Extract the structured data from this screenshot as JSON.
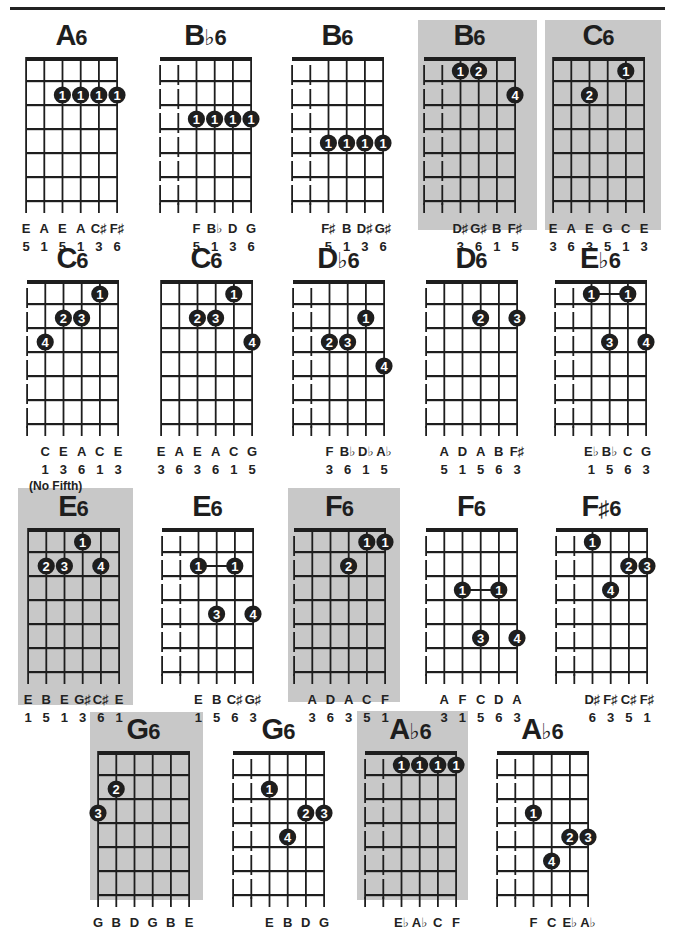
{
  "page": {
    "highlight_color": "#c8c8c8",
    "ink_color": "#1e1e1e"
  },
  "chords": [
    {
      "id": "a6",
      "root": "A",
      "suffix": "6",
      "highlighted": false,
      "x": 26,
      "nut_y": 57,
      "muted_low": 0,
      "dots": [
        {
          "s": 2,
          "f": 2,
          "n": "1"
        },
        {
          "s": 3,
          "f": 2,
          "n": "1"
        },
        {
          "s": 4,
          "f": 2,
          "n": "1"
        },
        {
          "s": 5,
          "f": 2,
          "n": "1"
        }
      ],
      "bar_links": [],
      "notes": [
        "E",
        "A",
        "E",
        "A",
        "C♯",
        "F♯"
      ],
      "degrees": [
        "5",
        "1",
        "5",
        "1",
        "3",
        "6"
      ]
    },
    {
      "id": "bb6",
      "root": "B",
      "suffix": "♭6",
      "highlighted": false,
      "x": 160,
      "nut_y": 57,
      "muted_low": 2,
      "dots": [
        {
          "s": 2,
          "f": 3,
          "n": "1"
        },
        {
          "s": 3,
          "f": 3,
          "n": "1"
        },
        {
          "s": 4,
          "f": 3,
          "n": "1"
        },
        {
          "s": 5,
          "f": 3,
          "n": "1"
        }
      ],
      "bar_links": [],
      "notes": [
        "",
        "",
        "F",
        "B♭",
        "D",
        "G"
      ],
      "degrees": [
        "",
        "",
        "5",
        "1",
        "3",
        "6"
      ]
    },
    {
      "id": "b6-a",
      "root": "B",
      "suffix": "6",
      "highlighted": false,
      "x": 292,
      "nut_y": 57,
      "muted_low": 2,
      "dots": [
        {
          "s": 2,
          "f": 4,
          "n": "1"
        },
        {
          "s": 3,
          "f": 4,
          "n": "1"
        },
        {
          "s": 4,
          "f": 4,
          "n": "1"
        },
        {
          "s": 5,
          "f": 4,
          "n": "1"
        }
      ],
      "bar_links": [],
      "notes": [
        "",
        "",
        "F♯",
        "B",
        "D♯",
        "G♯"
      ],
      "degrees": [
        "",
        "",
        "5",
        "1",
        "3",
        "6"
      ]
    },
    {
      "id": "b6-b",
      "root": "B",
      "suffix": "6",
      "highlighted": true,
      "x": 424,
      "nut_y": 57,
      "muted_low": 2,
      "dots": [
        {
          "s": 2,
          "f": 1,
          "n": "1"
        },
        {
          "s": 3,
          "f": 1,
          "n": "2"
        },
        {
          "s": 5,
          "f": 2,
          "n": "4"
        }
      ],
      "bar_links": [],
      "notes": [
        "",
        "",
        "D♯",
        "G♯",
        "B",
        "F♯"
      ],
      "degrees": [
        "",
        "",
        "3",
        "6",
        "1",
        "5"
      ]
    },
    {
      "id": "c6-a",
      "root": "C",
      "suffix": "6",
      "highlighted": true,
      "x": 553,
      "nut_y": 57,
      "muted_low": 0,
      "dots": [
        {
          "s": 4,
          "f": 1,
          "n": "1"
        },
        {
          "s": 2,
          "f": 2,
          "n": "2"
        }
      ],
      "bar_links": [],
      "notes": [
        "E",
        "A",
        "E",
        "G",
        "C",
        "E"
      ],
      "degrees": [
        "3",
        "6",
        "3",
        "5",
        "1",
        "3"
      ]
    },
    {
      "id": "c6-b",
      "root": "C",
      "suffix": "6",
      "highlighted": false,
      "x": 27,
      "nut_y": 280,
      "muted_low": 1,
      "dots": [
        {
          "s": 4,
          "f": 1,
          "n": "1"
        },
        {
          "s": 2,
          "f": 2,
          "n": "2"
        },
        {
          "s": 3,
          "f": 2,
          "n": "3"
        },
        {
          "s": 1,
          "f": 3,
          "n": "4"
        }
      ],
      "bar_links": [],
      "notes": [
        "",
        "C",
        "E",
        "A",
        "C",
        "E"
      ],
      "degrees": [
        "",
        "1",
        "3",
        "6",
        "1",
        "3"
      ],
      "footnote": "(No Fifth)"
    },
    {
      "id": "c6-c",
      "root": "C",
      "suffix": "6",
      "highlighted": false,
      "x": 161,
      "nut_y": 280,
      "muted_low": 0,
      "dots": [
        {
          "s": 4,
          "f": 1,
          "n": "1"
        },
        {
          "s": 2,
          "f": 2,
          "n": "2"
        },
        {
          "s": 3,
          "f": 2,
          "n": "3"
        },
        {
          "s": 5,
          "f": 3,
          "n": "4"
        }
      ],
      "bar_links": [],
      "notes": [
        "E",
        "A",
        "E",
        "A",
        "C",
        "G"
      ],
      "degrees": [
        "3",
        "6",
        "3",
        "6",
        "1",
        "5"
      ]
    },
    {
      "id": "db6",
      "root": "D",
      "suffix": "♭6",
      "highlighted": false,
      "x": 293,
      "nut_y": 280,
      "muted_low": 2,
      "dots": [
        {
          "s": 4,
          "f": 2,
          "n": "1"
        },
        {
          "s": 2,
          "f": 3,
          "n": "2"
        },
        {
          "s": 3,
          "f": 3,
          "n": "3"
        },
        {
          "s": 5,
          "f": 4,
          "n": "4"
        }
      ],
      "bar_links": [],
      "notes": [
        "",
        "",
        "F",
        "B♭",
        "D♭",
        "A♭"
      ],
      "degrees": [
        "",
        "",
        "3",
        "6",
        "1",
        "5"
      ]
    },
    {
      "id": "d6",
      "root": "D",
      "suffix": "6",
      "highlighted": false,
      "x": 426,
      "nut_y": 280,
      "muted_low": 1,
      "dots": [
        {
          "s": 3,
          "f": 2,
          "n": "2"
        },
        {
          "s": 5,
          "f": 2,
          "n": "3"
        }
      ],
      "bar_links": [],
      "notes": [
        "",
        "A",
        "D",
        "A",
        "B",
        "F♯"
      ],
      "degrees": [
        "",
        "5",
        "1",
        "5",
        "6",
        "3"
      ]
    },
    {
      "id": "eb6",
      "root": "E",
      "suffix": "♭6",
      "highlighted": false,
      "x": 555,
      "nut_y": 280,
      "muted_low": 2,
      "dots": [
        {
          "s": 2,
          "f": 1,
          "n": "1"
        },
        {
          "s": 4,
          "f": 1,
          "n": "1"
        },
        {
          "s": 3,
          "f": 3,
          "n": "3"
        },
        {
          "s": 5,
          "f": 3,
          "n": "4"
        }
      ],
      "bar_links": [
        {
          "f": 1,
          "from": 2,
          "to": 4
        }
      ],
      "notes": [
        "",
        "",
        "E♭",
        "B♭",
        "C",
        "G"
      ],
      "degrees": [
        "",
        "",
        "1",
        "5",
        "6",
        "3"
      ]
    },
    {
      "id": "e6-a",
      "root": "E",
      "suffix": "6",
      "highlighted": true,
      "x": 28,
      "nut_y": 528,
      "muted_low": 0,
      "dots": [
        {
          "s": 3,
          "f": 1,
          "n": "1"
        },
        {
          "s": 1,
          "f": 2,
          "n": "2"
        },
        {
          "s": 2,
          "f": 2,
          "n": "3"
        },
        {
          "s": 4,
          "f": 2,
          "n": "4"
        }
      ],
      "bar_links": [],
      "notes": [
        "E",
        "B",
        "E",
        "G♯",
        "C♯",
        "E"
      ],
      "degrees": [
        "1",
        "5",
        "1",
        "3",
        "6",
        "1"
      ]
    },
    {
      "id": "e6-b",
      "root": "E",
      "suffix": "6",
      "highlighted": false,
      "x": 162,
      "nut_y": 528,
      "muted_low": 2,
      "dots": [
        {
          "s": 2,
          "f": 2,
          "n": "1"
        },
        {
          "s": 4,
          "f": 2,
          "n": "1"
        },
        {
          "s": 3,
          "f": 4,
          "n": "3"
        },
        {
          "s": 5,
          "f": 4,
          "n": "4"
        }
      ],
      "bar_links": [
        {
          "f": 2,
          "from": 2,
          "to": 4
        }
      ],
      "notes": [
        "",
        "",
        "E",
        "B",
        "C♯",
        "G♯"
      ],
      "degrees": [
        "",
        "",
        "1",
        "5",
        "6",
        "3"
      ]
    },
    {
      "id": "f6-a",
      "root": "F",
      "suffix": "6",
      "highlighted": true,
      "x": 294,
      "nut_y": 528,
      "muted_low": 1,
      "dots": [
        {
          "s": 4,
          "f": 1,
          "n": "1"
        },
        {
          "s": 5,
          "f": 1,
          "n": "1"
        },
        {
          "s": 3,
          "f": 2,
          "n": "2"
        }
      ],
      "bar_links": [],
      "notes": [
        "",
        "A",
        "D",
        "A",
        "C",
        "F"
      ],
      "degrees": [
        "",
        "3",
        "6",
        "3",
        "5",
        "1"
      ]
    },
    {
      "id": "f6-b",
      "root": "F",
      "suffix": "6",
      "highlighted": false,
      "x": 426,
      "nut_y": 528,
      "muted_low": 1,
      "dots": [
        {
          "s": 2,
          "f": 3,
          "n": "1"
        },
        {
          "s": 4,
          "f": 3,
          "n": "1"
        },
        {
          "s": 3,
          "f": 5,
          "n": "3"
        },
        {
          "s": 5,
          "f": 5,
          "n": "4"
        }
      ],
      "bar_links": [
        {
          "f": 3,
          "from": 2,
          "to": 4
        }
      ],
      "notes": [
        "",
        "A",
        "F",
        "C",
        "D",
        "A"
      ],
      "degrees": [
        "",
        "3",
        "1",
        "5",
        "6",
        "3"
      ]
    },
    {
      "id": "fs6",
      "root": "F",
      "suffix": "♯6",
      "highlighted": false,
      "x": 556,
      "nut_y": 528,
      "muted_low": 2,
      "dots": [
        {
          "s": 2,
          "f": 1,
          "n": "1"
        },
        {
          "s": 4,
          "f": 2,
          "n": "2"
        },
        {
          "s": 5,
          "f": 2,
          "n": "3"
        },
        {
          "s": 3,
          "f": 3,
          "n": "4"
        }
      ],
      "bar_links": [],
      "notes": [
        "",
        "",
        "D♯",
        "F♯",
        "C♯",
        "F♯"
      ],
      "degrees": [
        "",
        "",
        "6",
        "3",
        "5",
        "1"
      ]
    },
    {
      "id": "g6-a",
      "root": "G",
      "suffix": "6",
      "highlighted": true,
      "x": 98,
      "nut_y": 751,
      "muted_low": 0,
      "dots": [
        {
          "s": 1,
          "f": 2,
          "n": "2"
        },
        {
          "s": 0,
          "f": 3,
          "n": "3"
        }
      ],
      "bar_links": [],
      "notes": [
        "G",
        "B",
        "D",
        "G",
        "B",
        "E"
      ],
      "degrees": []
    },
    {
      "id": "g6-b",
      "root": "G",
      "suffix": "6",
      "highlighted": false,
      "x": 233,
      "nut_y": 751,
      "muted_low": 2,
      "dots": [
        {
          "s": 2,
          "f": 2,
          "n": "1"
        },
        {
          "s": 4,
          "f": 3,
          "n": "2"
        },
        {
          "s": 5,
          "f": 3,
          "n": "3"
        },
        {
          "s": 3,
          "f": 4,
          "n": "4"
        }
      ],
      "bar_links": [],
      "notes": [
        "",
        "",
        "E",
        "B",
        "D",
        "G"
      ],
      "degrees": []
    },
    {
      "id": "ab6-a",
      "root": "A",
      "suffix": "♭6",
      "highlighted": true,
      "x": 365,
      "nut_y": 751,
      "muted_low": 2,
      "dots": [
        {
          "s": 2,
          "f": 1,
          "n": "1"
        },
        {
          "s": 3,
          "f": 1,
          "n": "1"
        },
        {
          "s": 4,
          "f": 1,
          "n": "1"
        },
        {
          "s": 5,
          "f": 1,
          "n": "1"
        }
      ],
      "bar_links": [],
      "notes": [
        "",
        "",
        "E♭",
        "A♭",
        "C",
        "F"
      ],
      "degrees": []
    },
    {
      "id": "ab6-b",
      "root": "A",
      "suffix": "♭6",
      "highlighted": false,
      "x": 497,
      "nut_y": 751,
      "muted_low": 2,
      "dots": [
        {
          "s": 2,
          "f": 3,
          "n": "1"
        },
        {
          "s": 4,
          "f": 4,
          "n": "2"
        },
        {
          "s": 5,
          "f": 4,
          "n": "3"
        },
        {
          "s": 3,
          "f": 5,
          "n": "4"
        }
      ],
      "bar_links": [],
      "notes": [
        "",
        "",
        "F",
        "C",
        "E♭",
        "A♭"
      ],
      "degrees": []
    }
  ],
  "highlight_boxes": [
    {
      "for": "b6-b",
      "x": 418,
      "y": 20,
      "w": 119,
      "h": 210
    },
    {
      "for": "c6-a",
      "x": 545,
      "y": 20,
      "w": 116,
      "h": 210
    },
    {
      "for": "e6-a",
      "x": 18,
      "y": 488,
      "w": 115,
      "h": 217
    },
    {
      "for": "f6-a",
      "x": 288,
      "y": 488,
      "w": 112,
      "h": 214
    },
    {
      "for": "g6-a",
      "x": 90,
      "y": 712,
      "w": 113,
      "h": 188
    },
    {
      "for": "ab6-a",
      "x": 357,
      "y": 711,
      "w": 111,
      "h": 189
    }
  ]
}
